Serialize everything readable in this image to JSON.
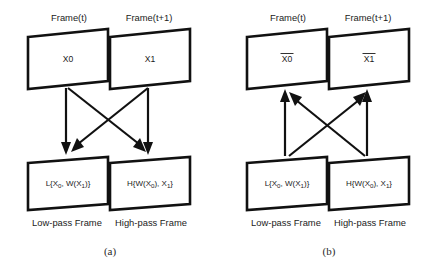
{
  "figure": {
    "panels": [
      {
        "id": "a",
        "label": "(a)",
        "direction": "downward",
        "top_boxes": [
          {
            "header": "Frame(t)",
            "content": "X0"
          },
          {
            "header": "Frame(t+1)",
            "content": "X1"
          }
        ],
        "bottom_boxes": [
          {
            "content_prefix": "L{X",
            "content_sub1": "0",
            "content_mid": ", W(X",
            "content_sub2": "1",
            "content_suffix": ")}",
            "caption": "Low-pass Frame"
          },
          {
            "content_prefix": "H{W(X",
            "content_sub1": "0",
            "content_mid": "), X",
            "content_sub2": "1",
            "content_suffix": "}",
            "caption": "High-pass Frame"
          }
        ]
      },
      {
        "id": "b",
        "label": "(b)",
        "direction": "upward",
        "top_boxes": [
          {
            "header": "Frame(t)",
            "content": "X0",
            "overline": true
          },
          {
            "header": "Frame(t+1)",
            "content": "X1",
            "overline": true
          }
        ],
        "bottom_boxes": [
          {
            "content_prefix": "L{X",
            "content_sub1": "0",
            "content_mid": ", W(X",
            "content_sub2": "1",
            "content_suffix": ")}",
            "caption": "Low-pass Frame"
          },
          {
            "content_prefix": "H{W(X",
            "content_sub1": "0",
            "content_mid": "), X",
            "content_sub2": "1",
            "content_suffix": "}",
            "caption": "High-pass Frame"
          }
        ]
      }
    ],
    "colors": {
      "stroke": "#111111",
      "text": "#1b1b1b",
      "background": "#ffffff"
    }
  }
}
